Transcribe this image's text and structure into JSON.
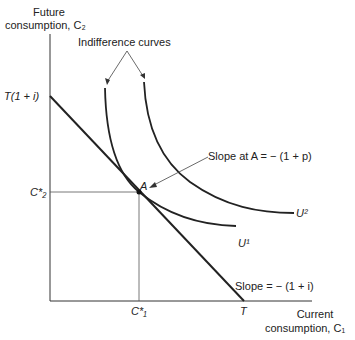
{
  "axes": {
    "y_label_line1": "Future",
    "y_label_line2": "consumption, C₂",
    "x_label_line1": "Current",
    "x_label_line2": "consumption, C₁"
  },
  "ticks": {
    "y_intercept": "T(1 + i)",
    "c2_star": "C*₂",
    "c1_star": "C*₁",
    "x_intercept": "T"
  },
  "annotations": {
    "indifference_curves": "Indifference curves",
    "slope_at_a": "Slope at A = − (1 + p)",
    "budget_slope": "Slope = − (1 + i)",
    "point_a": "A",
    "u1": "U¹",
    "u2": "U²"
  }
}
